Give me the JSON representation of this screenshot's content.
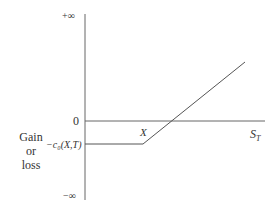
{
  "diagram": {
    "y_axis_label": [
      "Gain",
      "or",
      "loss"
    ],
    "y_ticks": {
      "top": "+∞",
      "zero": "0",
      "premium": "−c₀(X,T)",
      "bottom": "−∞"
    },
    "x_axis_label": "S_T",
    "strike_label": "X",
    "colors": {
      "line": "#555555",
      "text": "#333333"
    }
  }
}
